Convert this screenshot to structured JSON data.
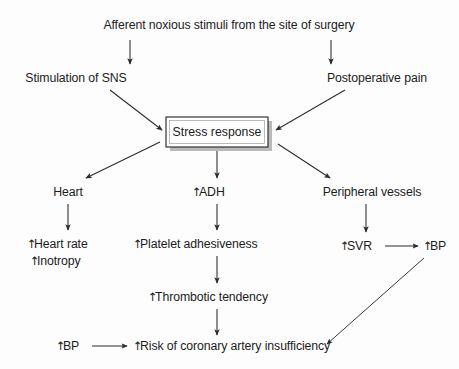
{
  "diagram": {
    "title_node": "Afferent noxious stimuli from the site of surgery",
    "background_color": "#fdfdfd",
    "line_color": "#2b2b2b",
    "text_color": "#1c1c1c",
    "central_box": {
      "label": "Stress response",
      "has_drop_shadow": true,
      "shadow_color": "#b9b9b9"
    },
    "nodes": {
      "stimulation_sns": "Stimulation of SNS",
      "postoperative_pain": "Postoperative pain",
      "heart": "Heart",
      "adh": "ADH",
      "peripheral_vessels": "Peripheral vessels",
      "heart_rate": "Heart rate",
      "inotropy": "Inotropy",
      "platelet_adhesiveness": "Platelet adhesiveness",
      "svr": "SVR",
      "bp_right": "BP",
      "thrombotic_tendency": "Thrombotic tendency",
      "bp_bottom": "BP",
      "risk_coronary": "Risk of coronary artery insufficiency"
    },
    "up_arrow_glyph": "↑",
    "nodes_with_up_arrow": [
      "adh",
      "heart_rate",
      "inotropy",
      "platelet_adhesiveness",
      "svr",
      "bp_right",
      "thrombotic_tendency",
      "bp_bottom",
      "risk_coronary"
    ],
    "edges": [
      {
        "from": "title_node",
        "to": "stimulation_sns",
        "style": "vertical"
      },
      {
        "from": "title_node",
        "to": "postoperative_pain",
        "style": "vertical"
      },
      {
        "from": "stimulation_sns",
        "to": "central_box",
        "style": "diagonal"
      },
      {
        "from": "postoperative_pain",
        "to": "central_box",
        "style": "diagonal"
      },
      {
        "from": "central_box",
        "to": "heart",
        "style": "diagonal"
      },
      {
        "from": "central_box",
        "to": "adh",
        "style": "vertical"
      },
      {
        "from": "central_box",
        "to": "peripheral_vessels",
        "style": "diagonal"
      },
      {
        "from": "heart",
        "to": "heart_rate",
        "style": "vertical"
      },
      {
        "from": "adh",
        "to": "platelet_adhesiveness",
        "style": "vertical"
      },
      {
        "from": "peripheral_vessels",
        "to": "svr",
        "style": "vertical"
      },
      {
        "from": "svr",
        "to": "bp_right",
        "style": "horizontal"
      },
      {
        "from": "platelet_adhesiveness",
        "to": "thrombotic_tendency",
        "style": "vertical"
      },
      {
        "from": "thrombotic_tendency",
        "to": "risk_coronary",
        "style": "vertical"
      },
      {
        "from": "bp_bottom",
        "to": "risk_coronary",
        "style": "horizontal"
      },
      {
        "from": "bp_right",
        "to": "risk_coronary",
        "style": "diagonal"
      }
    ]
  }
}
